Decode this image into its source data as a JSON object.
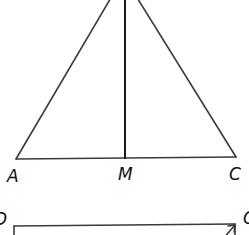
{
  "diagram": {
    "type": "geometry",
    "stroke_color": "#3a3a3a",
    "label_color": "#111111",
    "triangle": {
      "vertices": {
        "A": {
          "label": "A",
          "x": 16,
          "y": 159
        },
        "C": {
          "label": "C",
          "x": 236,
          "y": 157
        },
        "B_top_offscreen": {
          "x": 125,
          "y": -30
        }
      },
      "midpoint": {
        "label": "M",
        "x": 125,
        "y": 158
      },
      "median": {
        "from": "B",
        "to": "M"
      }
    },
    "labels": {
      "A": "A",
      "M": "M",
      "C": "C",
      "D": "D",
      "C2": "C"
    },
    "lower_figure": {
      "top_edge": {
        "from_label": "D",
        "to_label": "C"
      }
    }
  }
}
